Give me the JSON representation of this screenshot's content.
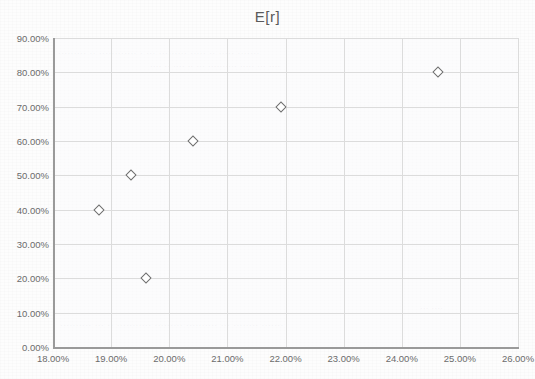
{
  "chart_data": {
    "type": "scatter",
    "title": "E[r]",
    "xlabel": "",
    "ylabel": "",
    "xlim": [
      0.18,
      0.26
    ],
    "ylim": [
      0.0,
      0.9
    ],
    "grid": true,
    "legend": null,
    "series_name": "E[r]",
    "marker": "open-diamond",
    "marker_color": "#6e6e6e",
    "x_tick_labels": [
      "18.00%",
      "19.00%",
      "20.00%",
      "21.00%",
      "22.00%",
      "23.00%",
      "24.00%",
      "25.00%",
      "26.00%"
    ],
    "x_tick_values": [
      0.18,
      0.19,
      0.2,
      0.21,
      0.22,
      0.23,
      0.24,
      0.25,
      0.26
    ],
    "y_tick_labels": [
      "0.00%",
      "10.00%",
      "20.00%",
      "30.00%",
      "40.00%",
      "50.00%",
      "60.00%",
      "70.00%",
      "80.00%",
      "90.00%"
    ],
    "y_tick_values": [
      0.0,
      0.1,
      0.2,
      0.3,
      0.4,
      0.5,
      0.6,
      0.7,
      0.8,
      0.9
    ],
    "points": [
      {
        "x": 0.1879,
        "y": 0.4,
        "x_label": "18.79%",
        "y_label": "40.00%"
      },
      {
        "x": 0.1934,
        "y": 0.5,
        "x_label": "19.34%",
        "y_label": "50.00%"
      },
      {
        "x": 0.196,
        "y": 0.2,
        "x_label": "19.60%",
        "y_label": "20.00%"
      },
      {
        "x": 0.2041,
        "y": 0.6,
        "x_label": "20.41%",
        "y_label": "60.00%"
      },
      {
        "x": 0.2193,
        "y": 0.7,
        "x_label": "21.93%",
        "y_label": "70.00%"
      },
      {
        "x": 0.2462,
        "y": 0.8,
        "x_label": "24.62%",
        "y_label": "80.00%"
      }
    ]
  },
  "background_bleed": {
    "top": "......... .. ............ . ... ......... ..... .. ..... .......",
    "middle": ".... .. .... .. ... .......... ..... ... ....",
    "lower": ".......... ... .. ........... ......... .......... ... ........ .......",
    "right": "... ...."
  },
  "colors": {
    "grid": "#dcdcdc",
    "axis": "#9a9a9a",
    "text": "#6b6b6b",
    "title": "#5a5a5a",
    "marker": "#6e6e6e",
    "plot_background": "#fcfcfd"
  }
}
